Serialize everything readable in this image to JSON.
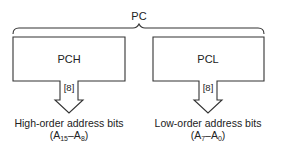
{
  "diagram": {
    "title": "PC",
    "registers": [
      {
        "name": "PCH",
        "bus_width": "[8]",
        "caption": "High-order address bits",
        "range": {
          "hi_base": "A",
          "hi_sub": "15",
          "lo_base": "A",
          "lo_sub": "8"
        }
      },
      {
        "name": "PCL",
        "bus_width": "[8]",
        "caption": "Low-order address bits",
        "range": {
          "hi_base": "A",
          "hi_sub": "7",
          "lo_base": "A",
          "lo_sub": "0"
        }
      }
    ]
  }
}
